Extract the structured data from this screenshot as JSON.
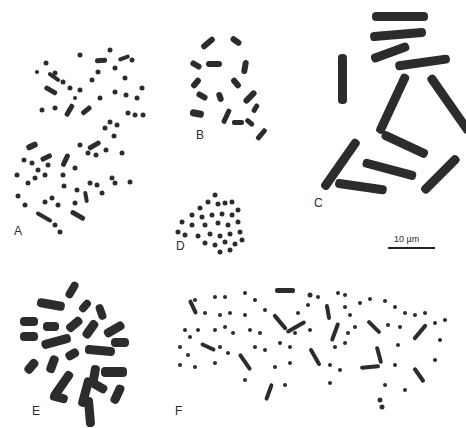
{
  "figure": {
    "panels": [
      {
        "id": "A",
        "label": "A",
        "description": "chromosome spread, many small chromosomes"
      },
      {
        "id": "B",
        "label": "B",
        "description": "chromosome spread, ~20 medium chromosomes"
      },
      {
        "id": "C",
        "label": "C",
        "description": "chromosome spread, large chromosomes"
      },
      {
        "id": "D",
        "label": "D",
        "description": "compact chromosome spread, small chromosomes"
      },
      {
        "id": "E",
        "label": "E",
        "description": "chromosome spread, thick condensed chromosomes"
      },
      {
        "id": "F",
        "label": "F",
        "description": "chromosome spread, many small chromosomes"
      }
    ],
    "scale_bar": {
      "label": "10 µm"
    },
    "colors": {
      "background": "#ffffff",
      "chromosome": "#2c2c2c",
      "text": "#2b2b2b"
    }
  }
}
